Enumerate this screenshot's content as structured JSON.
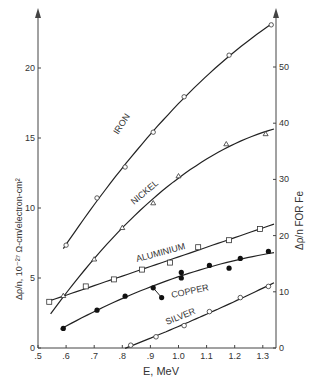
{
  "chart_data": {
    "type": "line",
    "title": "",
    "xlabel": "E, MeV",
    "ylabel": "Δρ/n, 10⁻²⁷ Ω-cm/electron-cm²",
    "ylabel_right": "Δρ/n FOR Fe",
    "xlim": [
      0.5,
      1.345
    ],
    "ylim": [
      0,
      23
    ],
    "ylim_right": [
      0,
      57.5
    ],
    "x_ticks": [
      0.5,
      0.6,
      0.7,
      0.8,
      0.9,
      1.0,
      1.1,
      1.2,
      1.3
    ],
    "x_tick_labels": [
      ".5",
      ".6",
      ".7",
      ".8",
      ".9",
      "1.0",
      "1.1",
      "1.2",
      "1.3"
    ],
    "y_ticks": [
      0,
      5,
      10,
      15,
      20
    ],
    "y_tick_labels": [
      "0",
      "5",
      "10",
      "15",
      "20"
    ],
    "y_ticks_right": [
      0,
      10,
      20,
      30,
      40,
      50
    ],
    "y_tick_labels_right": [
      "0",
      "10",
      "20",
      "30",
      "40",
      "50"
    ],
    "grid": false,
    "legend": "inline curve labels",
    "series": [
      {
        "name": "IRON",
        "axis": "right",
        "marker": "triangle-circle",
        "x": [
          0.6,
          0.71,
          0.81,
          0.91,
          1.02,
          1.18,
          1.33
        ],
        "y": [
          18.3,
          26.7,
          32.2,
          38.4,
          44.7,
          52.1,
          57.5
        ]
      },
      {
        "name": "NICKEL",
        "axis": "right",
        "marker": "triangle",
        "x": [
          0.59,
          0.7,
          0.8,
          0.91,
          1.0,
          1.17,
          1.31
        ],
        "y": [
          9.3,
          15.8,
          21.4,
          25.8,
          30.6,
          36.3,
          38.1
        ]
      },
      {
        "name": "ALUMINIUM",
        "axis": "left",
        "marker": "open-square",
        "x": [
          0.54,
          0.67,
          0.77,
          0.87,
          0.97,
          1.07,
          1.18,
          1.29
        ],
        "y": [
          3.3,
          4.4,
          4.9,
          5.6,
          6.1,
          7.2,
          7.7,
          8.5
        ]
      },
      {
        "name": "COPPER",
        "axis": "left",
        "marker": "filled-circle",
        "x": [
          0.59,
          0.71,
          0.81,
          0.91,
          0.94,
          1.01,
          1.01,
          1.11,
          1.18,
          1.22,
          1.32
        ],
        "y": [
          1.4,
          2.7,
          3.7,
          4.3,
          3.6,
          5.4,
          5.0,
          5.9,
          5.7,
          6.4,
          6.9
        ]
      },
      {
        "name": "SILVER",
        "axis": "left",
        "marker": "open-circle",
        "x": [
          0.83,
          0.92,
          1.02,
          1.11,
          1.22,
          1.32
        ],
        "y": [
          0.2,
          0.8,
          1.6,
          2.6,
          3.6,
          4.4
        ]
      }
    ]
  },
  "labels": {
    "iron": "IRON",
    "nickel": "NICKEL",
    "aluminium": "ALUMINIUM",
    "copper": "COPPER",
    "silver": "SILVER",
    "x_axis": "E, MeV",
    "y_axis_left": "Δρ/n, 10⁻²⁷  Ω-cm/electron-cm²",
    "y_axis_right": "Δρ/n FOR Fe"
  }
}
